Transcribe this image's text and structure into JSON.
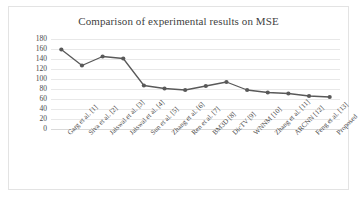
{
  "chart_data": {
    "type": "line",
    "title": "Comparison of experimental results on MSE",
    "xlabel": "",
    "ylabel": "",
    "ylim": [
      0,
      180
    ],
    "yticks": [
      0,
      20,
      40,
      60,
      80,
      100,
      120,
      140,
      160,
      180
    ],
    "grid": true,
    "legend": "none",
    "marker": "circle",
    "line_color": "#595959",
    "marker_color": "#595959",
    "gridline_color": "#e8e8e8",
    "categories": [
      "Garg et al. [1]",
      "Siva et al. [2]",
      "Jaiswal et al. [3]",
      "Jaiswal et al. [4]",
      "Sun et al. [5]",
      "Zhang et al. [6]",
      "Ren et al. [7]",
      "BM3D [8]",
      "DicTV [9]",
      "WNNM [10]",
      "Zhang et al. [11]",
      "ARCNN [12]",
      "Feng et al. [13]",
      "Proposed"
    ],
    "values": [
      159,
      127,
      145,
      141,
      87,
      81,
      78,
      86,
      94,
      78,
      73,
      71,
      66,
      64
    ]
  }
}
